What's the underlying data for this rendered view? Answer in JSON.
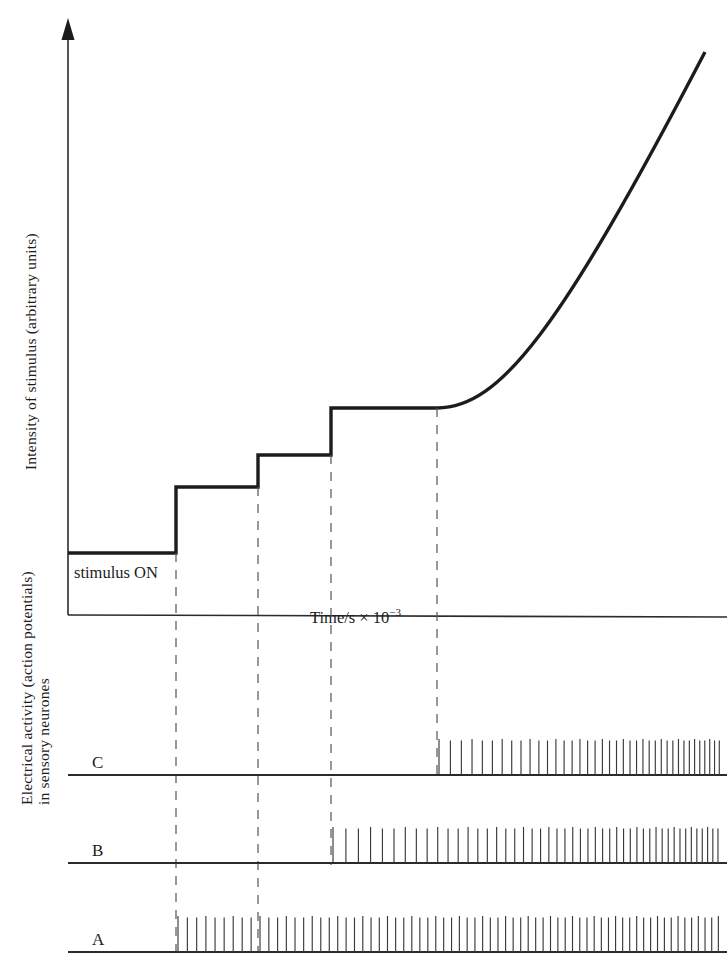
{
  "figure": {
    "kind": "physiology-stimulus-response-figure",
    "background_color": "#ffffff",
    "ink_color": "#1c1c1c",
    "guide_color": "#5c5c5c"
  },
  "top_panel": {
    "y_axis_label": "Intensity of stimulus (arbitrary units)",
    "x_axis_label_main": "Time/s × 10",
    "x_axis_label_exponent": "−3",
    "stimulus_on_label": "stimulus  ON",
    "y_axis_has_arrow": true
  },
  "bottom_panel": {
    "y_axis_label_line1": "Electrical activity (action potentials)",
    "y_axis_label_line2": "in sensory neurones",
    "traces": [
      {
        "label": "C",
        "baseline_y": 775,
        "onset_x": 437,
        "start_gap": 11.5,
        "end_gap": 4.6,
        "spike_height": 36
      },
      {
        "label": "B",
        "baseline_y": 863,
        "onset_x": 331,
        "start_gap": 13.0,
        "end_gap": 5.0,
        "spike_height": 36
      },
      {
        "label": "A",
        "baseline_y": 952,
        "onset_x": 176,
        "start_gap": 9.4,
        "end_gap": 6.6,
        "spike_height": 36
      }
    ]
  },
  "chart_data": {
    "type": "line",
    "title": "",
    "xlabel": "Time/s × 10⁻³",
    "ylabel": "Intensity of stimulus (arbitrary units)",
    "grid": false,
    "legend": "none",
    "series": [
      {
        "name": "Intensity of stimulus",
        "description": "Step staircase of increasing stimulus intensity followed by a smooth accelerating rise",
        "points_px": [
          [
            68,
            553
          ],
          [
            176,
            553
          ],
          [
            176,
            487
          ],
          [
            258,
            487
          ],
          [
            258,
            455
          ],
          [
            331,
            455
          ],
          [
            331,
            408
          ],
          [
            437,
            408
          ],
          [
            705,
            52
          ]
        ],
        "step_levels": [
          0,
          1,
          2,
          3
        ],
        "step_onset_x_px": [
          176,
          258,
          331
        ],
        "ramp_start_x_px": 437,
        "ramp_end_x_px": 705
      }
    ],
    "guide_lines_x_px": [
      176,
      258,
      331,
      437
    ],
    "spike_trains": [
      {
        "name": "A",
        "onset_x_px": 176,
        "description": "Fires from the first stimulus step onward; frequency rises modestly and stays high",
        "frequency_profile": "low-then-sustained-high"
      },
      {
        "name": "B",
        "onset_x_px": 331,
        "description": "Silent until the third stimulus step, then fires at increasing frequency",
        "frequency_profile": "threshold-then-increasing"
      },
      {
        "name": "C",
        "onset_x_px": 437,
        "description": "Highest threshold; fires only during the final smooth ramp, frequency accelerating",
        "frequency_profile": "high-threshold-accelerating"
      }
    ],
    "axis_px": {
      "top_panel_origin": [
        68,
        615
      ],
      "top_panel_y_top": 20,
      "top_panel_x_right": 727
    }
  }
}
